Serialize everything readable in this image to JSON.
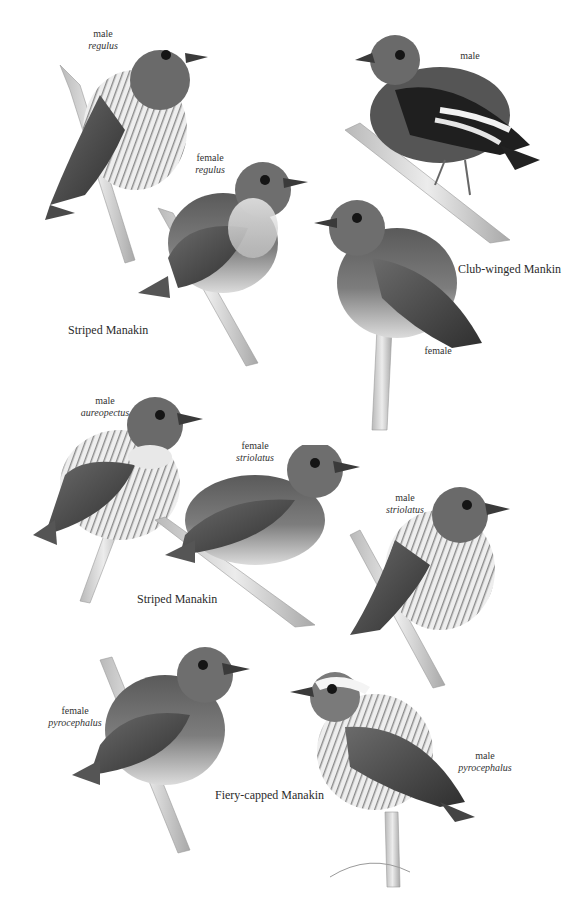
{
  "plate": {
    "background": "#ffffff",
    "palette": {
      "ink": "#2a2a2a",
      "body_dark": "#3d3d3d",
      "body_mid": "#7a7a7a",
      "body_light": "#c9c9c9",
      "belly": "#e8e8e8",
      "branch": "#d6d6d6"
    }
  },
  "species_labels": {
    "striped_top": "Striped Manakin",
    "club_winged": "Club-winged Mankin",
    "striped_middle": "Striped Manakin",
    "fiery_capped": "Fiery-capped Manakin"
  },
  "birds": [
    {
      "id": "striped-male-regulus",
      "sex": "male",
      "subspecies": "regulus"
    },
    {
      "id": "striped-female-regulus",
      "sex": "female",
      "subspecies": "regulus"
    },
    {
      "id": "club-winged-male",
      "sex": "male",
      "subspecies": ""
    },
    {
      "id": "club-winged-female",
      "sex": "female",
      "subspecies": ""
    },
    {
      "id": "striped-male-aureopectus",
      "sex": "male",
      "subspecies": "aureopectus"
    },
    {
      "id": "striped-female-striolatus",
      "sex": "female",
      "subspecies": "striolatus"
    },
    {
      "id": "striped-male-striolatus",
      "sex": "male",
      "subspecies": "striolatus"
    },
    {
      "id": "fiery-capped-female-pyrocephalus",
      "sex": "female",
      "subspecies": "pyrocephalus"
    },
    {
      "id": "fiery-capped-male-pyrocephalus",
      "sex": "male",
      "subspecies": "pyrocephalus"
    }
  ]
}
